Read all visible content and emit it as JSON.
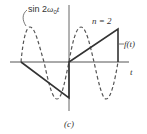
{
  "figure": {
    "caption": "(c)",
    "sine_label": "sin 2ω₀t",
    "sine_label_prefix": "sin 2",
    "sine_label_omega": "ω",
    "sine_label_sub": "0",
    "sine_label_t": "t",
    "n_label": "n = 2",
    "f_label": "f(t)",
    "t_axis_label": "t",
    "colors": {
      "axis": "#555555",
      "solid": "#333333",
      "dashed": "#555555",
      "background": "#ffffff"
    }
  }
}
